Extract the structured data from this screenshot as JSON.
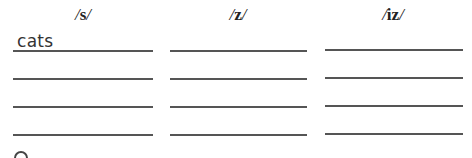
{
  "worksheet": {
    "columns": [
      {
        "header": "s",
        "answers": [
          "cats",
          "",
          "",
          ""
        ]
      },
      {
        "header": "z",
        "answers": [
          "",
          "",
          "",
          ""
        ]
      },
      {
        "header": "iz",
        "answers": [
          "",
          "",
          "",
          ""
        ]
      }
    ],
    "slash": "/"
  },
  "footer": {
    "icon": "circle-icon"
  }
}
